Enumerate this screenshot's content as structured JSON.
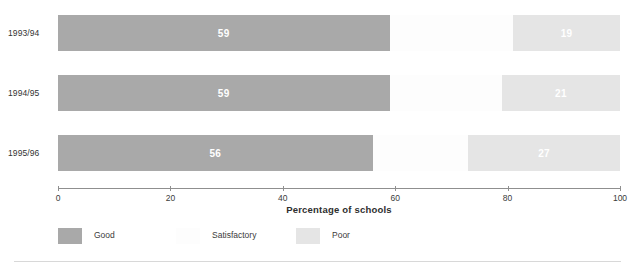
{
  "chart_data": {
    "type": "bar",
    "orientation": "horizontal",
    "stacked": true,
    "title": "",
    "xlabel": "Percentage of schools",
    "ylabel": "",
    "xlim": [
      0,
      100
    ],
    "grid": false,
    "legend_position": "bottom-left",
    "categories": [
      "1993/94",
      "1994/95",
      "1995/96"
    ],
    "series": [
      {
        "name": "Good",
        "color": "#a9a9a9",
        "values": [
          59,
          59,
          56
        ]
      },
      {
        "name": "Satisfactory",
        "color": "#fdfdfd",
        "values": [
          22,
          20,
          17
        ]
      },
      {
        "name": "Poor",
        "color": "#e5e5e5",
        "values": [
          19,
          21,
          27
        ]
      }
    ],
    "tick_labels": [
      "0",
      "20",
      "40",
      "60",
      "80",
      "100"
    ],
    "tick_values": [
      0,
      20,
      40,
      60,
      80,
      100
    ],
    "data_labels": {
      "1993/94": {
        "Good": "59",
        "Satisfactory": "",
        "Poor": "19"
      },
      "1994/95": {
        "Good": "59",
        "Satisfactory": "",
        "Poor": "21"
      },
      "1995/96": {
        "Good": "56",
        "Satisfactory": "",
        "Poor": "27"
      }
    }
  },
  "axis": {
    "title": "Percentage of schools",
    "ticks": [
      {
        "label": "0",
        "value": 0
      },
      {
        "label": "20",
        "value": 20
      },
      {
        "label": "40",
        "value": 40
      },
      {
        "label": "60",
        "value": 60
      },
      {
        "label": "80",
        "value": 80
      },
      {
        "label": "100",
        "value": 100
      }
    ]
  },
  "rows": [
    {
      "label": "1993/94",
      "segments": [
        {
          "name": "Good",
          "value": 59,
          "label": "59"
        },
        {
          "name": "Satisfactory",
          "value": 22,
          "label": ""
        },
        {
          "name": "Poor",
          "value": 19,
          "label": "19"
        }
      ]
    },
    {
      "label": "1994/95",
      "segments": [
        {
          "name": "Good",
          "value": 59,
          "label": "59"
        },
        {
          "name": "Satisfactory",
          "value": 20,
          "label": ""
        },
        {
          "name": "Poor",
          "value": 21,
          "label": "21"
        }
      ]
    },
    {
      "label": "1995/96",
      "segments": [
        {
          "name": "Good",
          "value": 56,
          "label": "56"
        },
        {
          "name": "Satisfactory",
          "value": 17,
          "label": ""
        },
        {
          "name": "Poor",
          "value": 27,
          "label": "27"
        }
      ]
    }
  ],
  "legend": [
    {
      "label": "Good",
      "color": "#a9a9a9",
      "x": 0
    },
    {
      "label": "Satisfactory",
      "color": "#fdfdfd",
      "x": 118
    },
    {
      "label": "Poor",
      "color": "#e5e5e5",
      "x": 238
    }
  ],
  "colors": {
    "good": "#a9a9a9",
    "satisfactory": "#fdfdfd",
    "poor": "#e5e5e5",
    "axis": "#8f8f8f",
    "text": "#3b3b3b",
    "background": "#ffffff"
  }
}
